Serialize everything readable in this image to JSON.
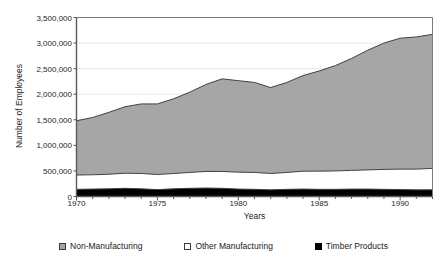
{
  "chart_data": {
    "type": "area",
    "stacked": true,
    "title": "",
    "xlabel": "Years",
    "ylabel": "Number of Employees",
    "xlim": [
      1970,
      1992
    ],
    "ylim": [
      0,
      3500000
    ],
    "ytick_labels": [
      "0",
      "500,000",
      "1,000,000",
      "1,500,000",
      "2,000,000",
      "2,500,000",
      "3,000,000",
      "3,500,000"
    ],
    "ytick_values": [
      0,
      500000,
      1000000,
      1500000,
      2000000,
      2500000,
      3000000,
      3500000
    ],
    "xtick_labels": [
      "1970",
      "1975",
      "1980",
      "1985",
      "1990"
    ],
    "xtick_values": [
      1970,
      1975,
      1980,
      1985,
      1990
    ],
    "minor_xticks": true,
    "grid": "horizontal",
    "legend_position": "bottom",
    "x": [
      1970,
      1971,
      1972,
      1973,
      1974,
      1975,
      1976,
      1977,
      1978,
      1979,
      1980,
      1981,
      1982,
      1983,
      1984,
      1985,
      1986,
      1987,
      1988,
      1989,
      1990,
      1991,
      1992
    ],
    "series": [
      {
        "name": "Timber Products",
        "color": "#000000",
        "values": [
          140000,
          145000,
          150000,
          160000,
          150000,
          135000,
          150000,
          160000,
          165000,
          160000,
          145000,
          140000,
          130000,
          140000,
          145000,
          140000,
          140000,
          145000,
          145000,
          140000,
          135000,
          130000,
          130000
        ]
      },
      {
        "name": "Other Manufacturing",
        "color": "#ffffff",
        "values": [
          280000,
          280000,
          285000,
          295000,
          300000,
          295000,
          300000,
          310000,
          325000,
          330000,
          330000,
          330000,
          320000,
          330000,
          350000,
          355000,
          360000,
          365000,
          375000,
          390000,
          400000,
          405000,
          420000
        ]
      },
      {
        "name": "Non-Manufacturing",
        "color": "#a6a6a6",
        "values": [
          1060000,
          1120000,
          1210000,
          1300000,
          1360000,
          1380000,
          1460000,
          1570000,
          1700000,
          1810000,
          1790000,
          1760000,
          1680000,
          1760000,
          1870000,
          1960000,
          2060000,
          2190000,
          2340000,
          2470000,
          2560000,
          2585000,
          2620000
        ]
      }
    ],
    "totals": [
      1480000,
      1545000,
      1645000,
      1755000,
      1810000,
      1810000,
      1910000,
      2040000,
      2190000,
      2300000,
      2265000,
      2230000,
      2130000,
      2230000,
      2365000,
      2455000,
      2560000,
      2700000,
      2860000,
      3000000,
      3095000,
      3120000,
      3170000
    ]
  },
  "legend": {
    "items": [
      {
        "label": "Non-Manufacturing",
        "swatch": "gray"
      },
      {
        "label": "Other Manufacturing",
        "swatch": "white"
      },
      {
        "label": "Timber Products",
        "swatch": "black"
      }
    ]
  },
  "colors": {
    "non_manufacturing": "#a6a6a6",
    "other_manufacturing": "#ffffff",
    "timber_products": "#000000",
    "axis": "#595959",
    "grid": "#e8e8e8",
    "line": "#404040"
  }
}
